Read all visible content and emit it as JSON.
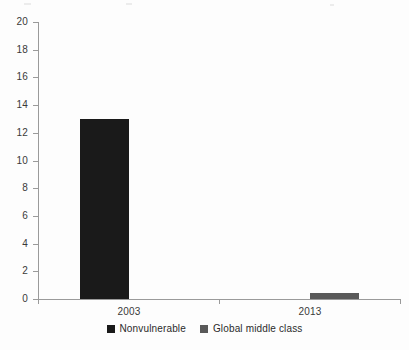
{
  "chart_data": {
    "type": "bar",
    "title": "",
    "subtitle": "",
    "xlabel": "",
    "ylabel": "",
    "categories": [
      "2003",
      "2013"
    ],
    "series": [
      {
        "name": "Nonvulnerable",
        "color": "#1a1a1a",
        "values": [
          13,
          0
        ]
      },
      {
        "name": "Global middle class",
        "color": "#595959",
        "values": [
          0,
          0.4
        ]
      }
    ],
    "ylim": [
      0,
      20
    ],
    "ytick_labels": [
      "0",
      "2",
      "4",
      "6",
      "8",
      "10",
      "12",
      "14",
      "16",
      "18",
      "20"
    ],
    "ytick_values": [
      0,
      2,
      4,
      6,
      8,
      10,
      12,
      14,
      16,
      18,
      20
    ],
    "grid": false,
    "legend_position": "bottom-center",
    "annotations": []
  },
  "legend": {
    "entries": [
      {
        "label": "Nonvulnerable",
        "color": "#1a1a1a"
      },
      {
        "label": "Global middle class",
        "color": "#595959"
      }
    ]
  },
  "axis": {
    "y_line_color": "#9a9a9a",
    "x_line_color": "#9a9a9a"
  }
}
